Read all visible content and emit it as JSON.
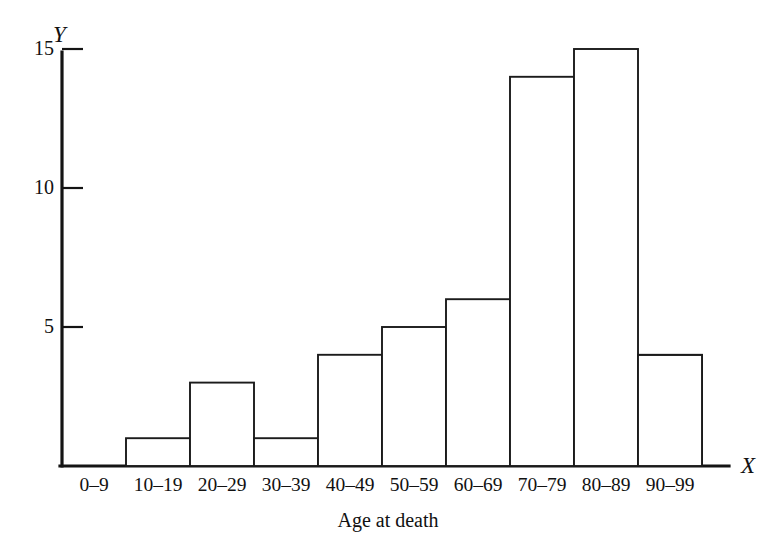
{
  "figure": {
    "background_color": "#ffffff",
    "ink_color": "#141414"
  },
  "axes": {
    "y_axis_name": "Y",
    "x_axis_name": "X",
    "x_caption": "Age at death",
    "y_tick_labels": [
      "5",
      "10",
      "15"
    ],
    "y_tick_values": [
      5,
      10,
      15
    ]
  },
  "chart_data": {
    "type": "bar",
    "title": "",
    "subtitle": "",
    "xlabel": "Age at death",
    "ylabel": "Y",
    "x_axis_symbol": "X",
    "y_axis_symbol": "Y",
    "categories": [
      "0–9",
      "10–19",
      "20–29",
      "30–39",
      "40–49",
      "50–59",
      "60–69",
      "70–79",
      "80–89",
      "90–99"
    ],
    "values": [
      6,
      1,
      3,
      1,
      4,
      5,
      6,
      14,
      15,
      4
    ],
    "ylim": [
      0,
      16.3
    ],
    "yticks": [
      5,
      10,
      15
    ],
    "grid": false,
    "legend": false,
    "legend_position": "none",
    "bar_fill": "#ffffff",
    "bar_edge": "#1b1b1b",
    "contiguous_bars": true,
    "note": "Histogram of age at death; bars are adjacent with no gaps, outlined only."
  }
}
